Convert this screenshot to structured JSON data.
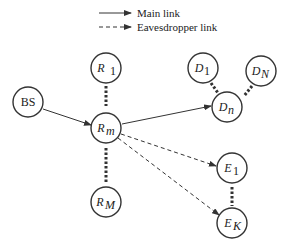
{
  "legend": {
    "main_link": "Main link",
    "eavesdropper_link": "Eavesdropper link"
  },
  "nodes": {
    "bs": {
      "label": "BS"
    },
    "r1": {
      "base": "R",
      "sub": "1"
    },
    "rm": {
      "base": "R",
      "sub": "m"
    },
    "rM": {
      "base": "R",
      "sub": "M"
    },
    "d1": {
      "base": "D",
      "sub": "1"
    },
    "dN": {
      "base": "D",
      "sub": "N"
    },
    "dn": {
      "base": "D",
      "sub": "n"
    },
    "e1": {
      "base": "E",
      "sub": "1"
    },
    "eK": {
      "base": "E",
      "sub": "K"
    }
  },
  "colors": {
    "stroke": "#333333",
    "text": "#222222"
  }
}
